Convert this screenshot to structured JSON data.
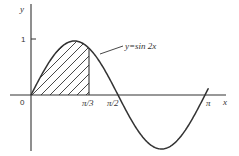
{
  "chart_data": {
    "type": "line",
    "title": "",
    "function": "y = sin 2x",
    "xlabel": "x",
    "ylabel": "y",
    "x_ticks": [
      {
        "value": 0,
        "label": "0"
      },
      {
        "value": 1.0472,
        "label": "π/3"
      },
      {
        "value": 1.5708,
        "label": "π/2"
      },
      {
        "value": 3.1416,
        "label": "π"
      }
    ],
    "y_ticks": [
      {
        "value": 1,
        "label": "1"
      }
    ],
    "xlim": [
      0,
      3.1416
    ],
    "ylim": [
      -1,
      1
    ],
    "series": [
      {
        "name": "y=sin 2x",
        "x": [
          0,
          0.2618,
          0.5236,
          0.7854,
          1.0472,
          1.309,
          1.5708,
          1.8326,
          2.0944,
          2.3562,
          2.618,
          2.8798,
          3.1416
        ],
        "values": [
          0,
          0.5,
          0.866,
          1,
          0.866,
          0.5,
          0,
          -0.5,
          -0.866,
          -1,
          -0.866,
          -0.5,
          0
        ]
      }
    ],
    "shaded_region": {
      "from": 0,
      "to": 1.0472,
      "style": "hatched",
      "description": "area under y=sin 2x from 0 to π/3"
    },
    "annotations": [
      {
        "text": "y=sin 2x",
        "arrow_to_x": 1.13
      }
    ],
    "grid": false,
    "legend": "none"
  },
  "labels": {
    "y_axis": "y",
    "x_axis": "x",
    "origin": "0",
    "one": "1",
    "pi_3": "π/3",
    "pi_2": "π/2",
    "pi": "π",
    "curve": "y=sin 2x"
  },
  "colors": {
    "line": "#333333",
    "background": "#ffffff"
  }
}
